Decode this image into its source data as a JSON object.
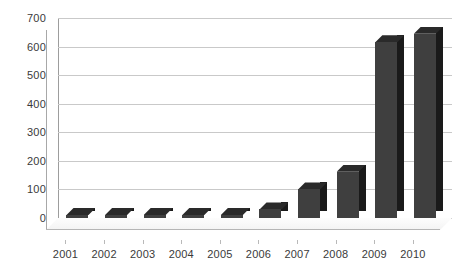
{
  "chart_data": {
    "type": "bar",
    "title": "",
    "subtitle": "",
    "xlabel": "",
    "ylabel": "",
    "categories": [
      "2001",
      "2002",
      "2003",
      "2004",
      "2005",
      "2006",
      "2007",
      "2008",
      "2009",
      "2010"
    ],
    "values": [
      4,
      4,
      5,
      6,
      8,
      30,
      100,
      162,
      615,
      645
    ],
    "series": [
      {
        "name": "Series 1",
        "values": [
          4,
          4,
          5,
          6,
          8,
          30,
          100,
          162,
          615,
          645
        ],
        "color": "#3f3f3f"
      }
    ],
    "ylim": [
      0,
      700
    ],
    "ytick_values": [
      0,
      100,
      200,
      300,
      400,
      500,
      600,
      700
    ],
    "ytick_labels": [
      "0",
      "100",
      "200",
      "300",
      "400",
      "500",
      "600",
      "700"
    ],
    "grid": true,
    "grid_axis": "y",
    "legend": false,
    "legend_position": "none",
    "style": "3d-column",
    "colors": {
      "bar_front": "#3f3f3f",
      "bar_side": "#1a1a1a",
      "bar_top": "#2a2a2a",
      "gridline": "#c9c9c9",
      "axis": "#9d9d9d",
      "background": "#ffffff",
      "text": "#3a3a3a"
    }
  }
}
